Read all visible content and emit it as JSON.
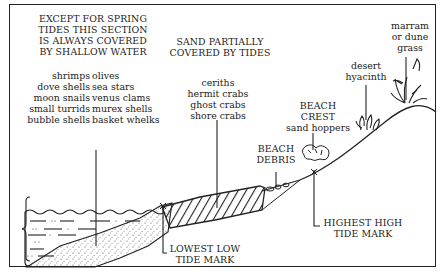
{
  "diagram": {
    "type": "beach-zonation-cross-section",
    "zones": {
      "subtidal": {
        "header": "EXCEPT FOR SPRING\nTIDES THIS SECTION\nIS ALWAYS COVERED\nBY SHALLOW WATER",
        "organisms_left": "shrimps\ndove shells\nmoon snails\nsmall turrids\nbubble shells",
        "organisms_right": "olives\nsea stars\nvenus clams\nmurex shells\nbasket whelks"
      },
      "intertidal": {
        "header": "SAND PARTIALLY\nCOVERED BY TIDES",
        "organisms": "ceriths\nhermit crabs\nghost crabs\nshore crabs"
      },
      "beach_debris": {
        "label": "BEACH\nDEBRIS"
      },
      "beach_crest": {
        "label": "BEACH\nCREST",
        "organisms": "sand hoppers"
      },
      "desert_hyacinth": {
        "label": "desert\nhyacinth"
      },
      "dune": {
        "label": "marram\nor dune\ngrass"
      }
    },
    "markers": {
      "lowest_low_tide": "LOWEST LOW\nTIDE MARK",
      "highest_high_tide": "HIGHEST HIGH\nTIDE MARK"
    },
    "colors": {
      "ink": "#222222",
      "background": "#ffffff"
    }
  }
}
